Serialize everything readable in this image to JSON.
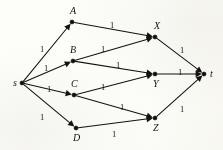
{
  "figure": {
    "kind": "directed-flow-network-diagram",
    "background_color": "#fdfdfa",
    "ink_color": "#14120f",
    "width": 223,
    "height": 150
  },
  "graph": {
    "nodes": [
      {
        "id": "s",
        "label": "s",
        "x": 22,
        "y": 83,
        "label_dx": -9,
        "label_dy": -5
      },
      {
        "id": "A",
        "label": "A",
        "x": 72,
        "y": 22,
        "label_dx": -2,
        "label_dy": -16
      },
      {
        "id": "B",
        "label": "B",
        "x": 73,
        "y": 61,
        "label_dx": -3,
        "label_dy": -16
      },
      {
        "id": "C",
        "label": "C",
        "x": 74,
        "y": 95,
        "label_dx": -3,
        "label_dy": -16
      },
      {
        "id": "D",
        "label": "D",
        "x": 76,
        "y": 128,
        "label_dx": -3,
        "label_dy": 5
      },
      {
        "id": "X",
        "label": "X",
        "x": 155,
        "y": 37,
        "label_dx": -1,
        "label_dy": -16
      },
      {
        "id": "Y",
        "label": "Y",
        "x": 155,
        "y": 74,
        "label_dx": -2,
        "label_dy": 5
      },
      {
        "id": "Z",
        "label": "Z",
        "x": 155,
        "y": 118,
        "label_dx": -2,
        "label_dy": 5
      },
      {
        "id": "t",
        "label": "t",
        "x": 204,
        "y": 74,
        "label_dx": 6,
        "label_dy": -5
      }
    ],
    "edges": [
      {
        "from": "s",
        "to": "A",
        "label": "1",
        "label_x": 40,
        "label_y": 45
      },
      {
        "from": "s",
        "to": "B",
        "label": "1",
        "label_x": 44,
        "label_y": 64
      },
      {
        "from": "s",
        "to": "C",
        "label": "1",
        "label_x": 47,
        "label_y": 85
      },
      {
        "from": "s",
        "to": "D",
        "label": "1",
        "label_x": 40,
        "label_y": 113
      },
      {
        "from": "A",
        "to": "X",
        "label": "1",
        "label_x": 110,
        "label_y": 21
      },
      {
        "from": "B",
        "to": "X",
        "label": "1",
        "label_x": 101,
        "label_y": 45
      },
      {
        "from": "B",
        "to": "Y",
        "label": "1",
        "label_x": 116,
        "label_y": 61
      },
      {
        "from": "C",
        "to": "Y",
        "label": "1",
        "label_x": 101,
        "label_y": 83
      },
      {
        "from": "C",
        "to": "Z",
        "label": "1",
        "label_x": 120,
        "label_y": 103
      },
      {
        "from": "D",
        "to": "Z",
        "label": "1",
        "label_x": 112,
        "label_y": 130
      },
      {
        "from": "X",
        "to": "t",
        "label": "1",
        "label_x": 180,
        "label_y": 46
      },
      {
        "from": "Y",
        "to": "t",
        "label": "1",
        "label_x": 178,
        "label_y": 68
      },
      {
        "from": "Z",
        "to": "t",
        "label": "1",
        "label_x": 180,
        "label_y": 105
      }
    ]
  }
}
